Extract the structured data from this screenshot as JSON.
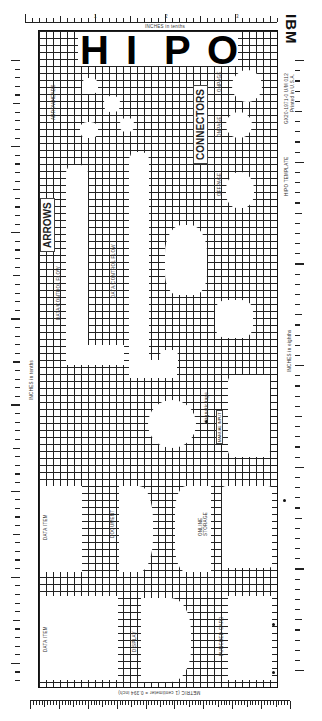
{
  "template": {
    "brand": "IBM",
    "title_letters": [
      "H",
      "I",
      "P",
      "O"
    ],
    "name": "HIPO TEMPLATE",
    "form_number": "GX20-1971-0 U/M 012",
    "printed_in": "Printed in U.S.A."
  },
  "rulers": {
    "top": {
      "label": "INCHES in tenths",
      "numbers": [
        "1",
        "2",
        "3"
      ]
    },
    "left": {
      "label": "INCHES in tenths",
      "numbers": [
        "9",
        "8",
        "7",
        "6",
        "5",
        "4",
        "3",
        "2",
        "1"
      ]
    },
    "right": {
      "label": "INCHES in eighths",
      "numbers": [
        "8",
        "7",
        "6",
        "5",
        "4",
        "3",
        "2",
        "1"
      ]
    },
    "bottom": {
      "label": "METRIC (1 centimeter = 0.394 inch)",
      "numbers": [
        "9",
        "8",
        "7",
        "6",
        "5",
        "4",
        "3",
        "2",
        "1"
      ]
    }
  },
  "sections": {
    "arrows": {
      "heading": "ARROWS",
      "arrowheads_label": "ARROWHEADS",
      "flow_label_1": "DATA/CONTROL FLOW",
      "flow_label_2": "DATA/CONTROL FLOW"
    },
    "connectors": {
      "heading": "CONNECTORS",
      "onpage_1": "ONPAGE",
      "onpage_2": "ONPAGE",
      "offpage": "OFFPAGE"
    },
    "symbols": {
      "magnetic_tape": "Magnetic tape",
      "manual_input": "MANUAL INPUT",
      "data_item_1": "DATA ITEM",
      "document": "DOCUMENT",
      "online_storage": "ONLINE STORAGE",
      "data_item_2": "DATA ITEM",
      "display": "DISPLAY",
      "punched_card": "PUNCHED CARD"
    }
  }
}
